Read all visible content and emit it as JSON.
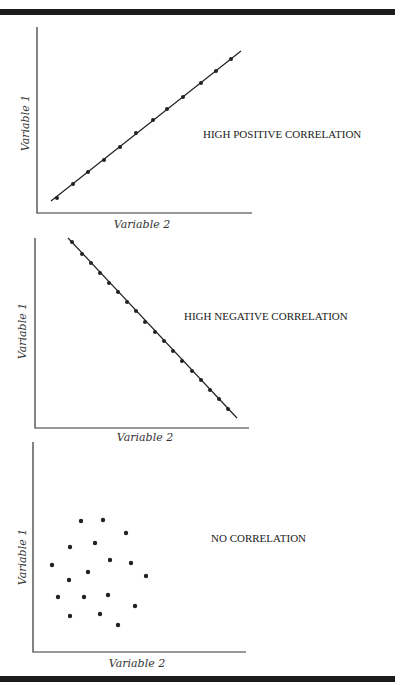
{
  "colors": {
    "ink": "#222222",
    "bar": "#1c1c1c",
    "background": "#ffffff"
  },
  "chart_data": [
    {
      "type": "scatter",
      "title": "HIGH POSITIVE CORRELATION",
      "xlabel": "Variable 2",
      "ylabel": "Variable 1",
      "grid": false,
      "trend_line": true,
      "points_px": [
        [
          57,
          198
        ],
        [
          73,
          184
        ],
        [
          88,
          172
        ],
        [
          104,
          160
        ],
        [
          120,
          147
        ],
        [
          136,
          133
        ],
        [
          153,
          120
        ],
        [
          167,
          109
        ],
        [
          183,
          97
        ],
        [
          201,
          83
        ],
        [
          216,
          71
        ],
        [
          231,
          59
        ]
      ],
      "x": [
        1,
        2,
        3,
        4,
        5,
        6,
        7,
        8,
        9,
        10,
        11,
        12
      ],
      "y": [
        1,
        2,
        3,
        4,
        5,
        6,
        7,
        8,
        9,
        10,
        11,
        12
      ]
    },
    {
      "type": "scatter",
      "title": "HIGH NEGATIVE CORRELATION",
      "xlabel": "Variable 2",
      "ylabel": "Variable 1",
      "grid": false,
      "trend_line": true,
      "points_px": [
        [
          72,
          242
        ],
        [
          82,
          254
        ],
        [
          91,
          263
        ],
        [
          100,
          273
        ],
        [
          109,
          283
        ],
        [
          118,
          292
        ],
        [
          127,
          302
        ],
        [
          136,
          311
        ],
        [
          145,
          322
        ],
        [
          155,
          332
        ],
        [
          164,
          341
        ],
        [
          173,
          351
        ],
        [
          182,
          361
        ],
        [
          192,
          371
        ],
        [
          201,
          380
        ],
        [
          210,
          390
        ],
        [
          219,
          399
        ],
        [
          228,
          409
        ]
      ],
      "x": [
        1,
        2,
        3,
        4,
        5,
        6,
        7,
        8,
        9,
        10,
        11,
        12,
        13,
        14,
        15,
        16,
        17,
        18
      ],
      "y": [
        18,
        17,
        16,
        15,
        14,
        13,
        12,
        11,
        10,
        9,
        8,
        7,
        6,
        5,
        4,
        3,
        2,
        1
      ]
    },
    {
      "type": "scatter",
      "title": "NO CORRELATION",
      "xlabel": "Variable 2",
      "ylabel": "Variable 1",
      "grid": false,
      "trend_line": false,
      "points_px": [
        [
          81,
          521
        ],
        [
          103,
          520
        ],
        [
          126,
          533
        ],
        [
          70,
          547
        ],
        [
          95,
          543
        ],
        [
          110,
          560
        ],
        [
          131,
          563
        ],
        [
          52,
          565
        ],
        [
          69,
          580
        ],
        [
          88,
          572
        ],
        [
          146,
          576
        ],
        [
          58,
          597
        ],
        [
          84,
          597
        ],
        [
          108,
          595
        ],
        [
          135,
          606
        ],
        [
          70,
          616
        ],
        [
          100,
          614
        ],
        [
          118,
          625
        ]
      ]
    }
  ],
  "panels": [
    {
      "label": "HIGH POSITIVE CORRELATION",
      "xlabel": "Variable 2",
      "ylabel": "Variable 1"
    },
    {
      "label": "HIGH NEGATIVE CORRELATION",
      "xlabel": "Variable 2",
      "ylabel": "Variable 1"
    },
    {
      "label": "NO CORRELATION",
      "xlabel": "Variable 2",
      "ylabel": "Variable 1"
    }
  ]
}
